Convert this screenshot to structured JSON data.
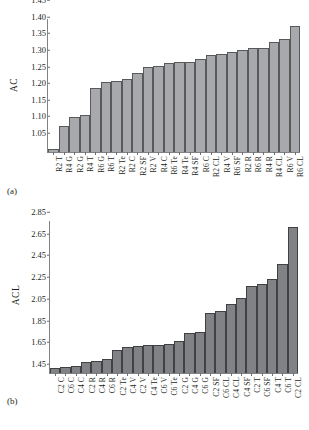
{
  "figure": {
    "panel_a_tag": "(a)",
    "panel_b_tag": "(b)"
  },
  "chart_data": [
    {
      "type": "bar",
      "panel": "(a)",
      "title": "",
      "xlabel": "",
      "ylabel": "AC",
      "ylim": [
        1.05,
        1.45
      ],
      "yticks": [
        1.45,
        1.4,
        1.35,
        1.3,
        1.25,
        1.2,
        1.15,
        1.1,
        1.05
      ],
      "ytick_labels": [
        "1.45",
        "1.40",
        "1.35",
        "1.30",
        "1.25",
        "1.20",
        "1.15",
        "1.10",
        "1.05"
      ],
      "grid": false,
      "legend": "none",
      "bar_color": "#a7a9ac",
      "bar_edge_color": "#58595b",
      "categories": [
        "R2 T",
        "R4 G",
        "R2 G",
        "R4 T",
        "R6 G",
        "R6 T",
        "R2 Te",
        "R2 C",
        "R2 SF",
        "R2 V",
        "R4 C",
        "R6 Te",
        "R4 Te",
        "R4 SF",
        "R6 C",
        "R2 CL",
        "R4 V",
        "R6 SF",
        "R2 R",
        "R6 R",
        "R4 R",
        "R4 CL",
        "R6 V",
        "R6 CL"
      ],
      "values": [
        1.058,
        1.128,
        1.155,
        1.161,
        1.242,
        1.261,
        1.264,
        1.269,
        1.287,
        1.306,
        1.309,
        1.317,
        1.32,
        1.322,
        1.331,
        1.341,
        1.345,
        1.35,
        1.356,
        1.362,
        1.364,
        1.38,
        1.391,
        1.43
      ]
    },
    {
      "type": "bar",
      "panel": "(b)",
      "title": "",
      "xlabel": "",
      "ylabel": "ACL",
      "ylim": [
        1.45,
        2.85
      ],
      "yticks": [
        2.85,
        2.65,
        2.45,
        2.25,
        2.05,
        1.85,
        1.65,
        1.45
      ],
      "ytick_labels": [
        "2.85",
        "2.65",
        "2.45",
        "2.25",
        "2.05",
        "1.85",
        "1.65",
        "1.45"
      ],
      "grid": false,
      "legend": "none",
      "bar_color": "#808285",
      "bar_edge_color": "#414042",
      "categories": [
        "C2 C",
        "C6 C",
        "C4 C",
        "C2 R",
        "C4 R",
        "C6 R",
        "C2 Te",
        "C4 V",
        "C2 V",
        "C4 Te",
        "C6 V",
        "C6 Te",
        "C2 G",
        "C4 G",
        "C6 G",
        "C2 SF",
        "C6 CL",
        "C4 CL",
        "C4 SF",
        "C2 T",
        "C6 SF",
        "C4 T",
        "C6 T",
        "C2 CL"
      ],
      "values": [
        1.5,
        1.505,
        1.512,
        1.552,
        1.565,
        1.58,
        1.662,
        1.686,
        1.7,
        1.705,
        1.71,
        1.72,
        1.748,
        1.822,
        1.83,
        2.005,
        2.025,
        2.085,
        2.14,
        2.255,
        2.27,
        2.32,
        2.455,
        2.795
      ]
    }
  ]
}
